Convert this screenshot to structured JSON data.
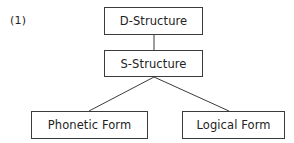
{
  "figure": {
    "example_number": "(1)",
    "line_color": "#3b3b3b",
    "text_color": "#232323",
    "background_color": "#ffffff"
  },
  "nodes": [
    {
      "id": "d-structure",
      "label": "D-Structure"
    },
    {
      "id": "s-structure",
      "label": "S-Structure"
    },
    {
      "id": "phonetic-form",
      "label": "Phonetic Form"
    },
    {
      "id": "logical-form",
      "label": "Logical Form"
    }
  ],
  "edges": [
    {
      "from": "d-structure",
      "to": "s-structure",
      "style": "vertical"
    },
    {
      "from": "s-structure",
      "to": "phonetic-form",
      "style": "diagonal"
    },
    {
      "from": "s-structure",
      "to": "logical-form",
      "style": "diagonal"
    }
  ]
}
